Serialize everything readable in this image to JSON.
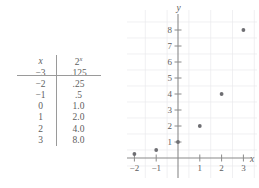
{
  "figure": {
    "kind": "math-figure-table-and-scatterplot"
  },
  "table": {
    "headers": {
      "x": "x",
      "fx_base": "2",
      "fx_exponent": "x"
    },
    "rows": [
      {
        "x": "−3",
        "y": ".125"
      },
      {
        "x": "−2",
        "y": ".25"
      },
      {
        "x": "−1",
        "y": ".5"
      },
      {
        "x": "0",
        "y": "1.0"
      },
      {
        "x": "1",
        "y": "2.0"
      },
      {
        "x": "2",
        "y": "4.0"
      },
      {
        "x": "3",
        "y": "8.0"
      }
    ]
  },
  "chart_data": {
    "type": "scatter",
    "title": "",
    "xlabel": "x",
    "ylabel": "y",
    "x": [
      -3,
      -2,
      -1,
      0,
      1,
      2,
      3
    ],
    "values": [
      0.125,
      0.25,
      0.5,
      1.0,
      2.0,
      4.0,
      8.0
    ],
    "series": [
      {
        "name": "2^x",
        "points": [
          {
            "x": -3,
            "y": 0.125
          },
          {
            "x": -2,
            "y": 0.25
          },
          {
            "x": -1,
            "y": 0.5
          },
          {
            "x": 0,
            "y": 1.0
          },
          {
            "x": 1,
            "y": 2.0
          },
          {
            "x": 2,
            "y": 4.0
          },
          {
            "x": 3,
            "y": 8.0
          }
        ]
      }
    ],
    "xlim": [
      -3.6,
      3.6
    ],
    "ylim": [
      -0.6,
      8.8
    ],
    "xticks": [
      -3,
      -2,
      -1,
      1,
      2,
      3
    ],
    "xticklabels": [
      "−3",
      "−2",
      "−1",
      "1",
      "2",
      "3"
    ],
    "yticks": [
      1,
      2,
      3,
      4,
      5,
      6,
      7,
      8
    ],
    "yticklabels": [
      "1",
      "2",
      "3",
      "4",
      "5",
      "6",
      "7",
      "8"
    ],
    "grid": true,
    "legend": false,
    "point_color": "#6e6e72",
    "grid_color": "#e9e9ec",
    "axis_color": "#8a8a8a"
  }
}
